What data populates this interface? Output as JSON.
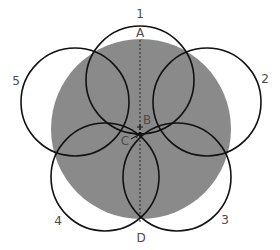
{
  "diagram": {
    "colors": {
      "disc_fill": "#8a8a8a",
      "circle_stroke": "#111111",
      "axis_stroke": "#222222",
      "label": "#4a4a4a",
      "background": "#ffffff"
    },
    "disc": {
      "cx": 141,
      "cy": 129,
      "r": 90
    },
    "circles": [
      {
        "id": "1",
        "label": "1",
        "cx": 140,
        "cy": 80,
        "r": 54,
        "label_x": 140,
        "label_y": 18
      },
      {
        "id": "2",
        "label": "2",
        "cx": 207,
        "cy": 102,
        "r": 54,
        "label_x": 265,
        "label_y": 83
      },
      {
        "id": "3",
        "label": "3",
        "cx": 177,
        "cy": 177,
        "r": 54,
        "label_x": 225,
        "label_y": 224
      },
      {
        "id": "4",
        "label": "4",
        "cx": 105,
        "cy": 177,
        "r": 54,
        "label_x": 58,
        "label_y": 225
      },
      {
        "id": "5",
        "label": "5",
        "cx": 75,
        "cy": 102,
        "r": 54,
        "label_x": 16,
        "label_y": 85
      }
    ],
    "points": [
      {
        "id": "A",
        "label": "A",
        "x": 140,
        "y": 37
      },
      {
        "id": "B",
        "label": "B",
        "x": 147,
        "y": 124
      },
      {
        "id": "C",
        "label": "C",
        "x": 125,
        "y": 145
      },
      {
        "id": "D",
        "label": "D",
        "x": 141,
        "y": 242
      }
    ],
    "axis": {
      "x": 140,
      "y1": 40,
      "y2": 222
    },
    "marker_b": {
      "x": 140,
      "y": 127
    },
    "center_c": {
      "x": 140,
      "y": 134
    }
  }
}
